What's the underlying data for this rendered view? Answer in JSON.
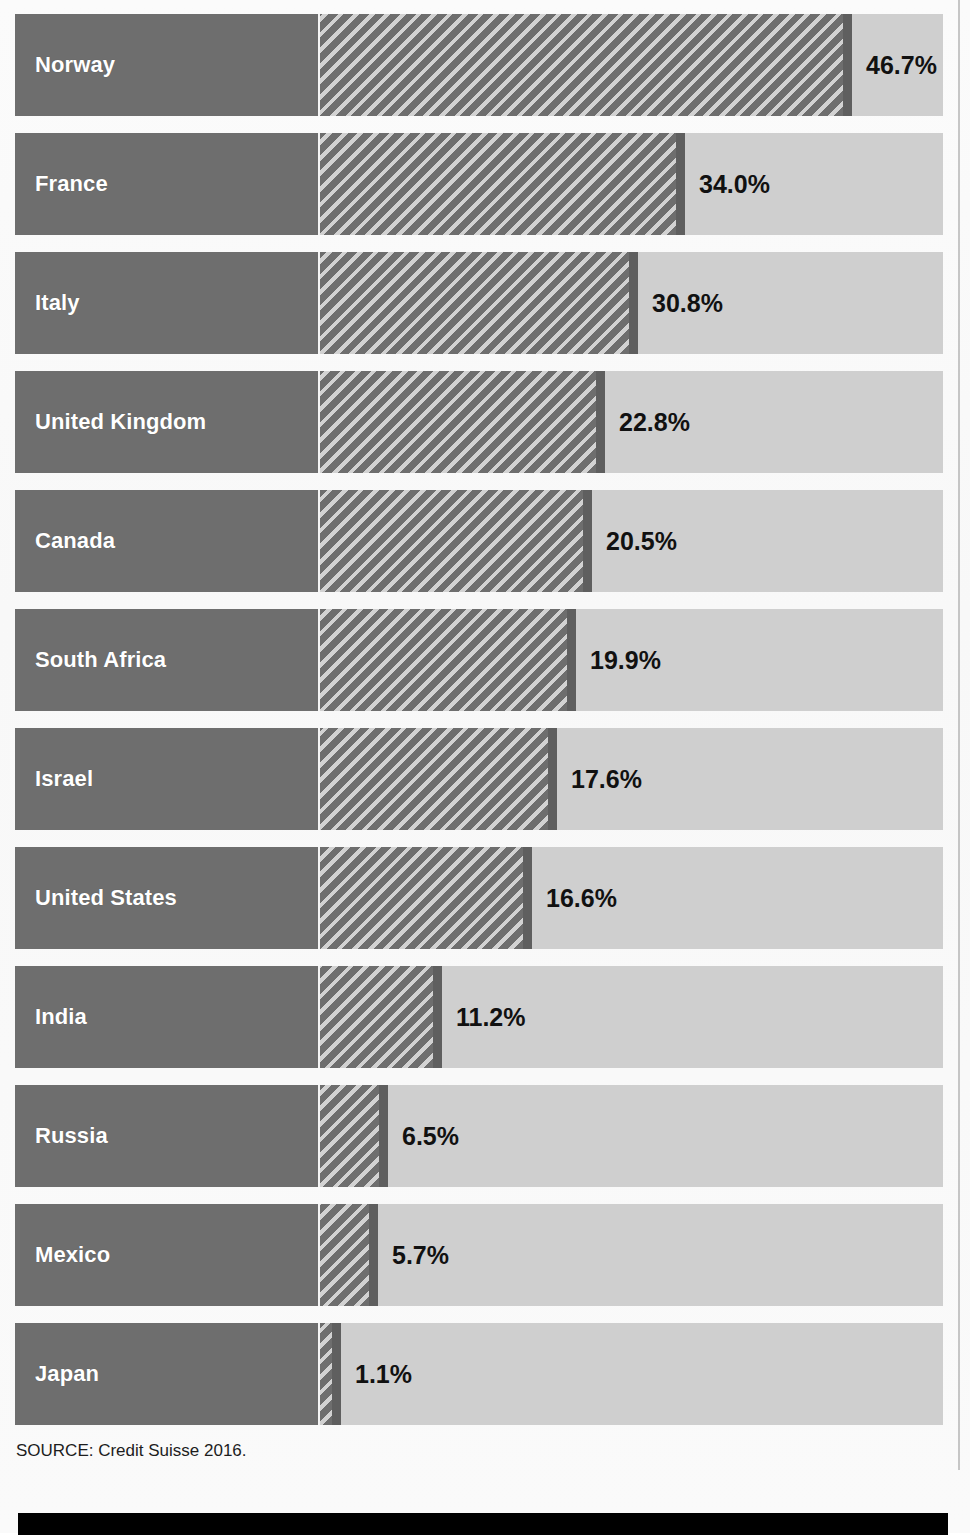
{
  "figure": {
    "title_partial": "",
    "source_note": "SOURCE: Credit Suisse 2016."
  },
  "chart_data": {
    "type": "bar",
    "orientation": "horizontal",
    "title": "",
    "subtitle": "",
    "xlabel": "",
    "ylabel": "",
    "xlim": [
      0,
      50
    ],
    "grid": false,
    "legend": null,
    "value_suffix": "%",
    "categories": [
      "Norway",
      "France",
      "Italy",
      "United Kingdom",
      "Canada",
      "South Africa",
      "Israel",
      "United States",
      "India",
      "Russia",
      "Mexico",
      "Japan"
    ],
    "values": [
      46.7,
      34.0,
      30.8,
      22.8,
      20.5,
      19.9,
      17.6,
      16.6,
      11.2,
      6.5,
      5.7,
      1.1
    ],
    "labels": [
      "46.7%",
      "34.0%",
      "30.8%",
      "22.8%",
      "20.5%",
      "19.9%",
      "17.6%",
      "16.6%",
      "11.2%",
      "6.5%",
      "5.7%",
      "1.1%"
    ],
    "source": "SOURCE: Credit Suisse 2016.",
    "colors": {
      "label_block": "#6e6e6e",
      "bar_hatch_dark": "#6e6e6e",
      "bar_hatch_light": "#d2d2d2",
      "bar_cap": "#5f5f5f",
      "track": "#cfcfcf",
      "label_text": "#ffffff",
      "value_text": "#111111",
      "page": "#fafafa",
      "footer_rule": "#000000"
    }
  },
  "rows": [
    {
      "name": "Norway",
      "value": "46.7%",
      "bar_px": 532,
      "value_left": 546
    },
    {
      "name": "France",
      "value": "34.0%",
      "bar_px": 365,
      "value_left": 379
    },
    {
      "name": "Italy",
      "value": "30.8%",
      "bar_px": 318,
      "value_left": 332
    },
    {
      "name": "United Kingdom",
      "value": "22.8%",
      "bar_px": 285,
      "value_left": 299
    },
    {
      "name": "Canada",
      "value": "20.5%",
      "bar_px": 272,
      "value_left": 286
    },
    {
      "name": "South Africa",
      "value": "19.9%",
      "bar_px": 256,
      "value_left": 270
    },
    {
      "name": "Israel",
      "value": "17.6%",
      "bar_px": 237,
      "value_left": 251
    },
    {
      "name": "United States",
      "value": "16.6%",
      "bar_px": 212,
      "value_left": 226
    },
    {
      "name": "India",
      "value": "11.2%",
      "bar_px": 122,
      "value_left": 136
    },
    {
      "name": "Russia",
      "value": "6.5%",
      "bar_px": 68,
      "value_left": 82
    },
    {
      "name": "Mexico",
      "value": "5.7%",
      "bar_px": 58,
      "value_left": 72
    },
    {
      "name": "Japan",
      "value": "1.1%",
      "bar_px": 21,
      "value_left": 35
    }
  ]
}
